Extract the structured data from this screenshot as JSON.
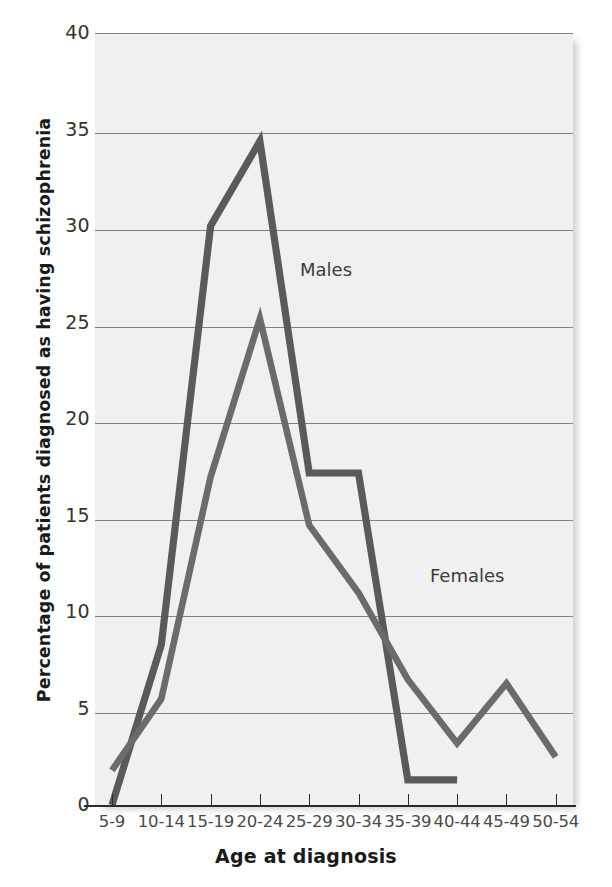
{
  "chart_data": {
    "type": "line",
    "title": "",
    "xlabel": "Age at diagnosis",
    "ylabel": "Percentage of patients diagnosed as having schizophrenia",
    "categories": [
      "5-9",
      "10-14",
      "15-19",
      "20-24",
      "25-29",
      "30-34",
      "35-39",
      "40-44",
      "45-49",
      "50-54"
    ],
    "ylim": [
      0,
      40
    ],
    "yticks": [
      0,
      5,
      10,
      15,
      20,
      25,
      30,
      35,
      40
    ],
    "grid": "horizontal",
    "legend_position": "inline-annotation",
    "series": [
      {
        "name": "Males",
        "color": "#5a5a5a",
        "values": [
          0,
          8.3,
          30.0,
          34.4,
          17.2,
          17.2,
          1.3,
          1.3,
          null,
          null
        ]
      },
      {
        "name": "Females",
        "color": "#6b6b6b",
        "values": [
          1.8,
          5.5,
          17.0,
          25.2,
          14.5,
          11.0,
          6.5,
          3.2,
          6.3,
          2.5
        ]
      }
    ],
    "annotations": [
      {
        "text": "Males",
        "x_category": "25-29",
        "y_value": 27.8
      },
      {
        "text": "Females",
        "x_category": "35-39",
        "y_value": 12.6
      }
    ]
  },
  "axis": {
    "y_tick_labels": [
      "40",
      "35",
      "30",
      "25",
      "20",
      "15",
      "10",
      "5",
      "0"
    ],
    "x_tick_labels": [
      "5-9",
      "10-14",
      "15-19",
      "20-24",
      "25-29",
      "30-34",
      "35-39",
      "40-44",
      "45-49",
      "50-54"
    ],
    "x_title": "Age at diagnosis",
    "y_title": "Percentage of patients diagnosed as having schizophrenia"
  },
  "annotations": {
    "males": "Males",
    "females": "Females"
  },
  "colors": {
    "plot_background": "#f0f0f0",
    "gridline": "#6f6f6f",
    "axis": "#2a2a2a",
    "males_line": "#5a5a5a",
    "females_line": "#6b6b6b",
    "tick_label": "#4a4a4a",
    "title_text": "#1a1a1a"
  }
}
